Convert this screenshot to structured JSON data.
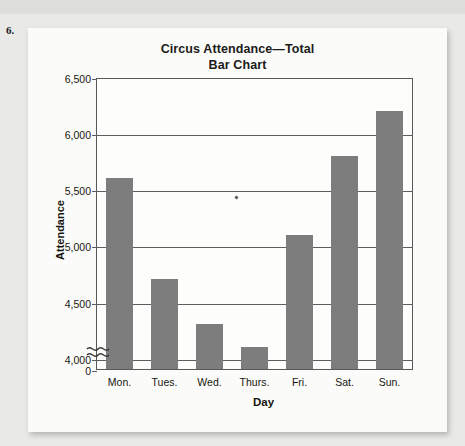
{
  "problem_number": "6.",
  "chart_data": {
    "type": "bar",
    "title": "Circus Attendance—Total",
    "subtitle": "Bar Chart",
    "xlabel": "Day",
    "ylabel": "Attendance",
    "categories": [
      "Mon.",
      "Tues.",
      "Wed.",
      "Thurs.",
      "Fri.",
      "Sat.",
      "Sun."
    ],
    "values": [
      5600,
      4700,
      4300,
      4100,
      5090,
      5800,
      6200
    ],
    "ytick_labels": [
      "6,500",
      "6,000",
      "5,500",
      "5,000",
      "4,500",
      "4,000",
      "0"
    ],
    "ytick_values": [
      6500,
      6000,
      5500,
      5000,
      4500,
      4000,
      0
    ],
    "ylim": [
      3900,
      6500
    ],
    "axis_break": true,
    "axis_break_between": [
      0,
      4000
    ],
    "grid": true,
    "legend": "none",
    "bar_color": "#7d7d7d",
    "frame_color": "#58585a",
    "plot_background": "#fdfdfc"
  }
}
